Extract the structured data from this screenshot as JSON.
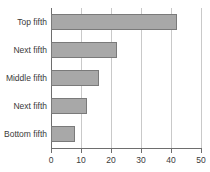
{
  "chart_data": {
    "type": "bar",
    "orientation": "horizontal",
    "title": "",
    "subtitle": "",
    "xlabel": "",
    "ylabel": "",
    "categories": [
      "Top fifth",
      "Next fifth",
      "Middle fifth",
      "Next fifth",
      "Bottom fifth"
    ],
    "values": [
      42,
      22,
      16,
      12,
      8
    ],
    "xlim": [
      0,
      50
    ],
    "xticks": [
      0,
      10,
      20,
      30,
      40,
      50
    ],
    "xtick_labels": [
      "0",
      "10",
      "20",
      "30",
      "40",
      "50"
    ],
    "grid": true,
    "grid_axis": "x",
    "legend": false,
    "legend_position": "none",
    "colors": {
      "bar_fill": "#a8a8a8",
      "bar_border": "#7a7a7a",
      "gridline": "#c9c9c9",
      "axis_line": "#6e6e6e",
      "text": "#3a3a3a",
      "background": "#ffffff"
    }
  }
}
